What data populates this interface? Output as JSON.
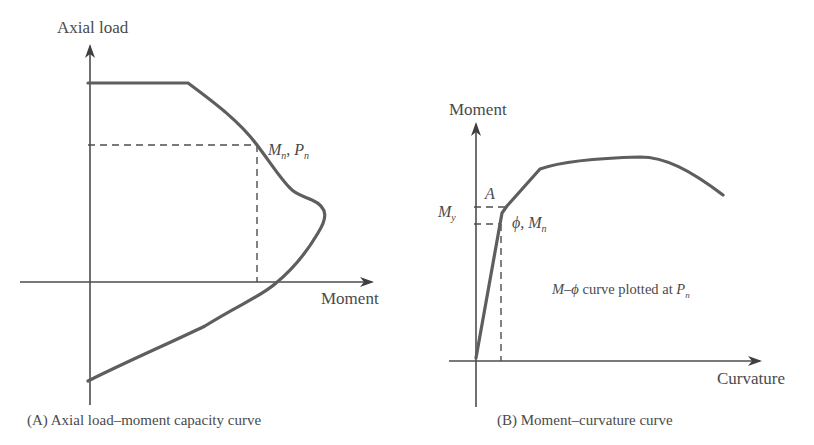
{
  "figure": {
    "panel_a": {
      "y_axis_label": "Axial load",
      "x_axis_label": "Moment",
      "point_label_m": "M",
      "point_label_m_sub": "n",
      "point_label_sep": ", ",
      "point_label_p": "P",
      "point_label_p_sub": "n",
      "caption": "(A) Axial load–moment capacity curve"
    },
    "panel_b": {
      "y_axis_label": "Moment",
      "x_axis_label": "Curvature",
      "point_a_label": "A",
      "my_label": "M",
      "my_label_sub": "y",
      "phi_mn_label_phi": "ϕ, ",
      "phi_mn_label_m": "M",
      "phi_mn_label_sub": "n",
      "note_prefix": "M–ϕ",
      "note_text": " curve plotted at ",
      "note_p": "P",
      "note_p_sub": "n",
      "caption": "(B) Moment–curvature curve"
    },
    "colors": {
      "curve": "#5e5e5e",
      "axis": "#4d4d4d",
      "text": "#4a4a4a"
    }
  }
}
